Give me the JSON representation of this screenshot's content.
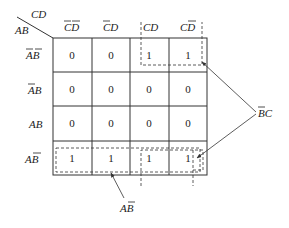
{
  "corner": {
    "col_var": "CD",
    "row_var": "AB"
  },
  "columns": [
    {
      "id": "c00",
      "text": "CD",
      "bars": [
        0,
        1
      ]
    },
    {
      "id": "c01",
      "text": "CD",
      "bars": [
        0
      ]
    },
    {
      "id": "c11",
      "text": "CD",
      "bars": []
    },
    {
      "id": "c10",
      "text": "CD",
      "bars": [
        1
      ]
    }
  ],
  "rows": [
    {
      "id": "r00",
      "text": "AB",
      "bars": [
        0,
        1
      ],
      "cells": [
        "0",
        "0",
        "1",
        "1"
      ]
    },
    {
      "id": "r01",
      "text": "AB",
      "bars": [
        0
      ],
      "cells": [
        "0",
        "0",
        "0",
        "0"
      ]
    },
    {
      "id": "r11",
      "text": "AB",
      "bars": [],
      "cells": [
        "0",
        "0",
        "0",
        "0"
      ]
    },
    {
      "id": "r10",
      "text": "AB",
      "bars": [
        1
      ],
      "cells": [
        "1",
        "1",
        "1",
        "1"
      ]
    }
  ],
  "groups": [
    {
      "name": "BC",
      "label_text": "BC",
      "label_bars": [
        0
      ],
      "description": "B̄C group: columns CD and CD̄ (wraps top and bottom rows)"
    },
    {
      "name": "AB",
      "label_text": "AB",
      "label_bars": [
        1
      ],
      "description": "AB̄ group: entire bottom row"
    }
  ],
  "colors": {
    "line": "#333333",
    "text": "#222222",
    "background": "#ffffff"
  }
}
